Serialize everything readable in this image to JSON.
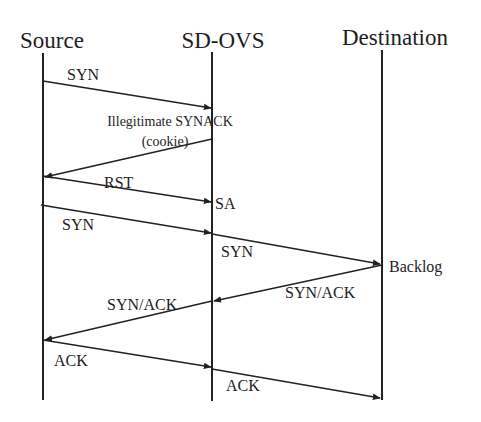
{
  "diagram": {
    "type": "sequence",
    "actors": [
      {
        "name": "Source",
        "x": 43
      },
      {
        "name": "SD-OVS",
        "x": 212
      },
      {
        "name": "Destination",
        "x": 382
      }
    ],
    "messages": [
      {
        "label": "SYN",
        "from": "Source",
        "to": "SD-OVS"
      },
      {
        "label": "Illegitimate SYNACK",
        "sublabel": "(cookie)",
        "from": "SD-OVS",
        "to": "Source"
      },
      {
        "label": "RST",
        "from": "Source",
        "to": "SD-OVS"
      },
      {
        "label": "SYN",
        "from": "Source",
        "to": "SD-OVS"
      },
      {
        "label": "SYN",
        "from": "SD-OVS",
        "to": "Destination"
      },
      {
        "label": "SYN/ACK",
        "from": "Destination",
        "to": "SD-OVS"
      },
      {
        "label": "SYN/ACK",
        "from": "SD-OVS",
        "to": "Source"
      },
      {
        "label": "ACK",
        "from": "Source",
        "to": "SD-OVS"
      },
      {
        "label": "ACK",
        "from": "SD-OVS",
        "to": "Destination"
      }
    ],
    "annotations": [
      {
        "text": "SA",
        "at": "SD-OVS"
      },
      {
        "text": "Backlog",
        "at": "Destination"
      }
    ],
    "line_color": "#222222",
    "background": "#ffffff"
  }
}
